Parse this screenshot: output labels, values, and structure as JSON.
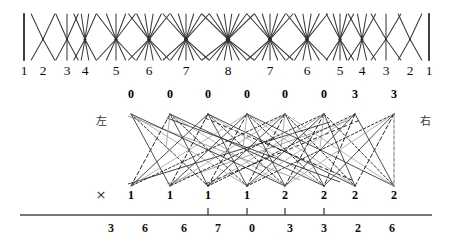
{
  "figure_top": {
    "name": "symmetric-fan-lattice",
    "axis_labels": [
      "1",
      "2",
      "3",
      "4",
      "5",
      "6",
      "7",
      "8",
      "7",
      "6",
      "5",
      "4",
      "3",
      "2",
      "1"
    ],
    "label_x": [
      24,
      43,
      67,
      85,
      116,
      149,
      186,
      228,
      270,
      307,
      340,
      362,
      386,
      410,
      429
    ],
    "node_x": [
      24,
      43,
      67,
      85,
      116,
      149,
      186,
      228,
      270,
      307,
      340,
      362,
      386,
      410,
      429
    ],
    "fan_counts": [
      1,
      2,
      3,
      4,
      5,
      6,
      7,
      8,
      7,
      6,
      5,
      4,
      3,
      2,
      1
    ],
    "band_top": 14,
    "band_bottom": 60,
    "line_color": "#3a3a3a"
  },
  "figure_bottom": {
    "name": "bipartite-crossing-diagram",
    "left_annotation": "左",
    "right_annotation": "右",
    "cross_mark": "×",
    "top_nodes": {
      "labels": [
        "0",
        "0",
        "0",
        "0",
        "0",
        "0",
        "3",
        "3"
      ],
      "x": [
        131,
        170,
        208,
        247,
        285,
        324,
        355,
        394
      ]
    },
    "bottom_nodes": {
      "labels": [
        "1",
        "1",
        "1",
        "1",
        "2",
        "2",
        "2",
        "2"
      ],
      "x": [
        131,
        170,
        208,
        247,
        285,
        324,
        355,
        394
      ]
    },
    "left_annotation_x": 101,
    "right_annotation_x": 425,
    "cross_mark_x": 101,
    "node_top_y": 16,
    "node_bot_y": 100,
    "dashed_guide_x": 394,
    "axis": {
      "y": 127,
      "x_start": 20,
      "x_end": 432,
      "numbers": [
        "3",
        "6",
        "6",
        "7",
        "0",
        "3",
        "3",
        "2",
        "6"
      ],
      "numbers_x": [
        111,
        145,
        184,
        218,
        252,
        290,
        324,
        358,
        392
      ],
      "ticks_x": [
        208,
        247,
        285,
        324
      ],
      "tick_height": 7,
      "color": "#4a4a4a"
    },
    "edge_color_solid": "#2e2e2e",
    "edge_color_light": "#9a9a9a",
    "edge_color_dashed": "#1a1a1a"
  }
}
